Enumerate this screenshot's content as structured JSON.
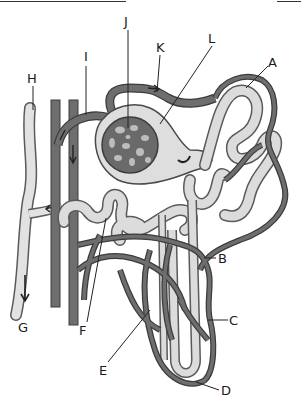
{
  "figure": {
    "colors": {
      "vessel": "#6e6e6e",
      "vessel_outline": "#3c3c3c",
      "tubule": "#dcdcdc",
      "tubule_outline": "#5a5a5a",
      "glomerulus": "#6a6a6a",
      "background": "#ffffff",
      "label_text": "#1a1a1a"
    },
    "labels": [
      {
        "id": "A",
        "text": "A",
        "x": 268,
        "y": 56
      },
      {
        "id": "B",
        "text": "B",
        "x": 218,
        "y": 252
      },
      {
        "id": "C",
        "text": "C",
        "x": 229,
        "y": 314
      },
      {
        "id": "D",
        "text": "D",
        "x": 221,
        "y": 384
      },
      {
        "id": "E",
        "text": "E",
        "x": 99,
        "y": 364
      },
      {
        "id": "F",
        "text": "F",
        "x": 79,
        "y": 324
      },
      {
        "id": "G",
        "text": "G",
        "x": 18,
        "y": 321
      },
      {
        "id": "H",
        "text": "H",
        "x": 27,
        "y": 72
      },
      {
        "id": "I",
        "text": "I",
        "x": 84,
        "y": 50
      },
      {
        "id": "J",
        "text": "J",
        "x": 124,
        "y": 15
      },
      {
        "id": "K",
        "text": "K",
        "x": 156,
        "y": 41
      },
      {
        "id": "L",
        "text": "L",
        "x": 208,
        "y": 32
      }
    ]
  }
}
